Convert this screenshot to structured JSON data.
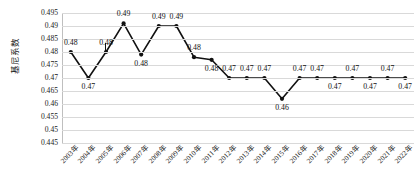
{
  "chart_data": {
    "type": "line",
    "title": "",
    "xlabel": "",
    "ylabel": "基尼系数",
    "ylim": [
      0.445,
      0.495
    ],
    "ytick_labels": [
      "0.495",
      "0.49",
      "0.485",
      "0.48",
      "0.475",
      "0.47",
      "0.465",
      "0.46",
      "0.455",
      "0.45",
      "0.445"
    ],
    "ytick_values": [
      0.495,
      0.49,
      0.485,
      0.48,
      0.475,
      0.47,
      0.465,
      0.46,
      0.455,
      0.45,
      0.445
    ],
    "grid": true,
    "legend": "none",
    "categories": [
      "2003年",
      "2004年",
      "2005年",
      "2006年",
      "2007年",
      "2008年",
      "2009年",
      "2010年",
      "2011年",
      "2012年",
      "2013年",
      "2014年",
      "2015年",
      "2016年",
      "2017年",
      "2018年",
      "2019年",
      "2020年",
      "2021年",
      "2022年"
    ],
    "values": [
      0.48,
      0.47,
      0.48,
      0.491,
      0.479,
      0.49,
      0.49,
      0.478,
      0.477,
      0.47,
      0.47,
      0.47,
      0.462,
      0.47,
      0.47,
      0.47,
      0.47,
      0.47,
      0.47,
      0.47
    ],
    "data_labels": [
      "0.48",
      "0.47",
      "0.48",
      "0.49",
      "0.48",
      "0.49",
      "0.49",
      "0.48",
      "0.48",
      "0.47",
      "0.47",
      "0.47",
      "0.46",
      "0.47",
      "0.47",
      "0.47",
      "0.47",
      "0.47",
      "0.47",
      "0.47"
    ],
    "label_positions": [
      "above",
      "below",
      "above",
      "above",
      "below",
      "above",
      "above",
      "above",
      "below",
      "above",
      "above",
      "above",
      "below",
      "above",
      "above",
      "below",
      "above",
      "below",
      "above",
      "below"
    ],
    "marker": "circle",
    "marker_color": "#111111",
    "line_color": "#111111"
  }
}
